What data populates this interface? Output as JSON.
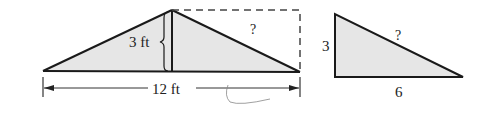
{
  "figure_left": {
    "height_label": "3 ft",
    "base_label": "12 ft",
    "hypotenuse_label": "?"
  },
  "figure_right": {
    "vertical_label": "3",
    "base_label": "6",
    "hypotenuse_label": "?"
  },
  "colors": {
    "fill": "#e6e6e6",
    "stroke": "#1a1a1a",
    "dash": "#444444"
  }
}
